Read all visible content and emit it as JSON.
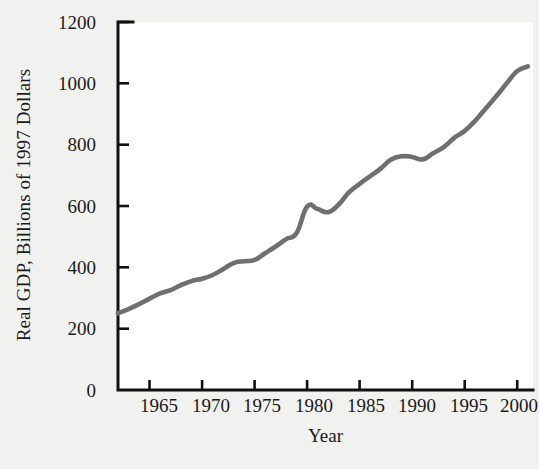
{
  "chart_data": {
    "type": "line",
    "title": "",
    "xlabel": "Year",
    "ylabel": "Real GDP, Billions of 1997 Dollars",
    "xlim": [
      1962,
      2001.5
    ],
    "ylim": [
      0,
      1200
    ],
    "grid": false,
    "legend": null,
    "line_color": "#706f6e",
    "axis_color": "#111111",
    "background_color": "#f1f1ef",
    "plot_background_color": "#ffffff",
    "xticks": [
      1965,
      1970,
      1975,
      1980,
      1985,
      1990,
      1995,
      2000
    ],
    "xtick_labels": [
      "1965",
      "1970",
      "1975",
      "1980",
      "1985",
      "1990",
      "1995",
      "2000"
    ],
    "yticks": [
      0,
      200,
      400,
      600,
      800,
      1000,
      1200
    ],
    "ytick_labels": [
      "0",
      "200",
      "400",
      "600",
      "800",
      "1000",
      "1200"
    ],
    "series": [
      {
        "name": "Real GDP",
        "x": [
          1962,
          1963,
          1964,
          1965,
          1966,
          1967,
          1968,
          1969,
          1970,
          1971,
          1972,
          1973,
          1974,
          1975,
          1976,
          1977,
          1978,
          1979,
          1980,
          1981,
          1982,
          1983,
          1984,
          1985,
          1986,
          1987,
          1988,
          1989,
          1990,
          1991,
          1992,
          1993,
          1994,
          1995,
          1996,
          1997,
          1998,
          1999,
          2000,
          2001
        ],
        "values": [
          250,
          264,
          280,
          298,
          315,
          326,
          342,
          355,
          363,
          375,
          394,
          414,
          420,
          424,
          446,
          468,
          492,
          512,
          598,
          590,
          580,
          605,
          645,
          672,
          697,
          722,
          752,
          762,
          760,
          752,
          772,
          792,
          822,
          845,
          878,
          918,
          958,
          1000,
          1040,
          1055
        ],
        "description": "Real GDP rises steadily from about 250 billion in 1962 to about 1055 billion in 2001, with a dip around 1980-1982 and a plateau around 1989-1991."
      }
    ],
    "notes": {
      "start_value": 250,
      "end_value": 1055,
      "recession_dip_1980_1982": true,
      "plateau_1989_1991": true
    }
  },
  "axes": {
    "y_title": "Real GDP, Billions of 1997 Dollars",
    "x_title": "Year"
  }
}
